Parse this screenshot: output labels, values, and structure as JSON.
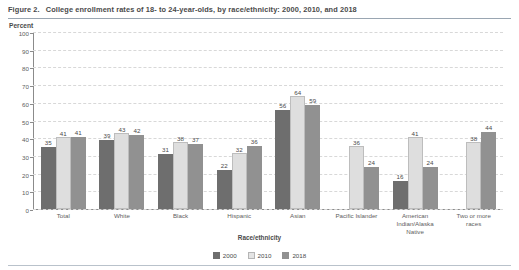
{
  "figure": {
    "number_label": "Figure 2.",
    "title": "College enrollment rates of 18- to 24-year-olds, by race/ethnicity: 2000, 2010, and 2018",
    "y_unit_label": "Percent"
  },
  "chart_data": {
    "type": "bar",
    "title": "College enrollment rates of 18- to 24-year-olds, by race/ethnicity: 2000, 2010, and 2018",
    "xlabel": "Race/ethnicity",
    "ylabel": "Percent",
    "ylim": [
      0,
      100
    ],
    "yticks": [
      0,
      10,
      20,
      30,
      40,
      50,
      60,
      70,
      80,
      90,
      100
    ],
    "ytick_labels": [
      "0",
      "10",
      "20",
      "30",
      "40",
      "50",
      "60",
      "70",
      "80",
      "90",
      "100"
    ],
    "grid": true,
    "legend_position": "bottom-center",
    "categories": [
      "Total",
      "White",
      "Black",
      "Hispanic",
      "Asian",
      "Pacific Islander",
      "American Indian/Alaska Native",
      "Two or more races"
    ],
    "category_lines": [
      [
        "Total"
      ],
      [
        "White"
      ],
      [
        "Black"
      ],
      [
        "Hispanic"
      ],
      [
        "Asian"
      ],
      [
        "Pacific Islander"
      ],
      [
        "American",
        "Indian/Alaska",
        "Native"
      ],
      [
        "Two or more",
        "races"
      ]
    ],
    "series": [
      {
        "name": "2000",
        "color": "#6e6e6e",
        "values": [
          35,
          39,
          31,
          22,
          56,
          null,
          16,
          null
        ],
        "labels": [
          "35",
          "39",
          "31",
          "22",
          "56",
          "",
          "16",
          ""
        ]
      },
      {
        "name": "2010",
        "color": "#dedede",
        "values": [
          41,
          43,
          38,
          32,
          64,
          36,
          41,
          38
        ],
        "labels": [
          "41",
          "43",
          "38",
          "32",
          "64",
          "36",
          "41",
          "38"
        ]
      },
      {
        "name": "2018",
        "color": "#919191",
        "values": [
          41,
          42,
          37,
          36,
          59,
          24,
          24,
          44
        ],
        "labels": [
          "41",
          "42",
          "37",
          "36",
          "59",
          "24",
          "24",
          "44"
        ]
      }
    ]
  },
  "legend": {
    "items": [
      {
        "label": "2000"
      },
      {
        "label": "2010"
      },
      {
        "label": "2018"
      }
    ]
  }
}
